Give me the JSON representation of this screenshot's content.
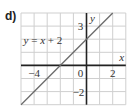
{
  "panel_label": "d)",
  "chart_data": {
    "type": "line",
    "title": "",
    "xlabel": "x",
    "ylabel": "y",
    "xlim": [
      -5,
      3
    ],
    "ylim": [
      -3,
      4
    ],
    "grid": true,
    "x_tick_labels": [
      "-4",
      "0",
      "2"
    ],
    "y_tick_labels": [
      "3",
      "-2"
    ],
    "series": [
      {
        "name": "y = x + 2",
        "x": [
          -5,
          2
        ],
        "y": [
          -3,
          4
        ]
      }
    ],
    "annotations": [
      "y = x + 2"
    ],
    "colors": {
      "line": "#6b6b6b",
      "grid": "#cfcfcf",
      "axis": "#222222"
    }
  }
}
